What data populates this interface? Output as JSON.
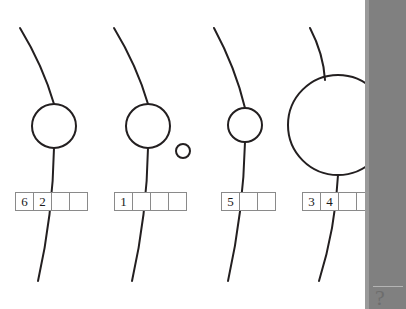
{
  "canvas": {
    "width": 406,
    "height": 309,
    "background": "#ffffff",
    "stroke_color": "#231f20",
    "cell_border_color": "#8a8a8a",
    "text_color": "#1a1a1a"
  },
  "figure": {
    "title": ""
  },
  "groups": [
    {
      "id": "group-1",
      "circle": {
        "cx": 54,
        "cy": 126,
        "r": 22
      },
      "satellite": null,
      "stem": {
        "x1": 20,
        "y1": 28,
        "x2": 54,
        "y2": 104
      },
      "tail": {
        "x1": 54,
        "y1": 148,
        "x2": 38,
        "y2": 281
      },
      "cells": [
        "6",
        "2",
        "",
        ""
      ],
      "row_left": 15,
      "row_top": 192
    },
    {
      "id": "group-2",
      "circle": {
        "cx": 148,
        "cy": 126,
        "r": 22
      },
      "satellite": {
        "cx": 183,
        "cy": 151,
        "r": 7
      },
      "stem": {
        "x1": 114,
        "y1": 28,
        "x2": 148,
        "y2": 104
      },
      "tail": {
        "x1": 148,
        "y1": 148,
        "x2": 132,
        "y2": 281
      },
      "cells": [
        "1",
        "",
        "",
        ""
      ],
      "row_left": 114,
      "row_top": 192
    },
    {
      "id": "group-3",
      "circle": {
        "cx": 245,
        "cy": 125,
        "r": 17
      },
      "satellite": null,
      "stem": {
        "x1": 214,
        "y1": 28,
        "x2": 245,
        "y2": 108
      },
      "tail": {
        "x1": 245,
        "y1": 142,
        "x2": 228,
        "y2": 281
      },
      "cells": [
        "5",
        "",
        ""
      ],
      "row_left": 221,
      "row_top": 192
    },
    {
      "id": "group-4",
      "circle": {
        "cx": 338,
        "cy": 125,
        "r": 50
      },
      "satellite": null,
      "stem": {
        "x1": 310,
        "y1": 28,
        "x2": 325,
        "y2": 80
      },
      "tail": {
        "x1": 338,
        "y1": 175,
        "x2": 319,
        "y2": 281
      },
      "cells": [
        "3",
        "4",
        "",
        ""
      ],
      "row_left": 302,
      "row_top": 192
    }
  ],
  "right_panel": {
    "left": 365,
    "background_color": "#808080",
    "edge_color": "#9a9a9a",
    "mark_glyph": "?"
  }
}
